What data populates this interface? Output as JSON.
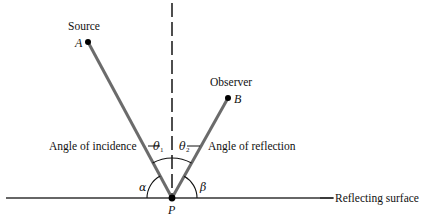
{
  "diagram": {
    "source": {
      "label": "Source",
      "point": "A",
      "x": 88,
      "y": 42
    },
    "observer": {
      "label": "Observer",
      "point": "B",
      "x": 228,
      "y": 98
    },
    "reflection_point": {
      "label": "P",
      "x": 172,
      "y": 198
    },
    "surface": {
      "label": "Reflecting surface",
      "x1": 6,
      "x2": 333,
      "y": 198
    },
    "normal": {
      "style": "dashed",
      "x": 172
    },
    "angles": {
      "incidence": {
        "label": "Angle of incidence",
        "symbol": "θ",
        "subscript": "1"
      },
      "reflection": {
        "label": "Angle of reflection",
        "symbol": "θ",
        "subscript": "2"
      },
      "alpha": {
        "symbol": "α"
      },
      "beta": {
        "symbol": "β"
      }
    },
    "colors": {
      "ray": "#6b6b6b",
      "surface": "#333333",
      "text": "#111111"
    }
  }
}
